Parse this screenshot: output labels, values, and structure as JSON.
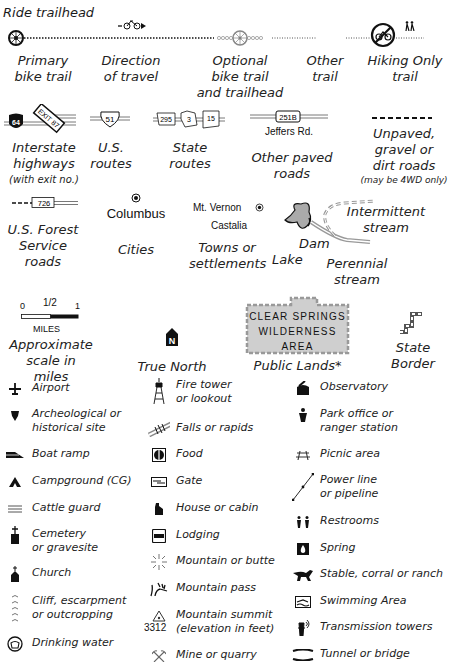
{
  "trails": {
    "ride_trailhead": "Ride trailhead",
    "primary": [
      "Primary",
      "bike trail"
    ],
    "direction": [
      "Direction",
      "of travel"
    ],
    "optional": [
      "Optional",
      "bike trail",
      "and trailhead"
    ],
    "other": [
      "Other",
      "trail"
    ],
    "hiking": [
      "Hiking Only",
      "trail"
    ]
  },
  "roads": {
    "interstate": {
      "shield": "64",
      "exit": "EXIT 87",
      "label": [
        "Interstate",
        "highways"
      ],
      "note": "(with exit no.)"
    },
    "us": {
      "shield": "51",
      "label": [
        "U.S.",
        "routes"
      ]
    },
    "state": {
      "shields": [
        "295",
        "3",
        "15"
      ],
      "label": [
        "State",
        "routes"
      ]
    },
    "other_paved": {
      "shield": "251B",
      "road_name": "Jeffers Rd.",
      "label": "Other paved roads"
    },
    "unpaved": {
      "label": [
        "Unpaved,",
        "gravel or",
        "dirt roads"
      ],
      "note": "(may be 4WD only)"
    },
    "forest": {
      "shield": "726",
      "label": [
        "U.S. Forest",
        "Service roads"
      ]
    }
  },
  "places": {
    "city_name": "Columbus",
    "cities_label": "Cities",
    "town1": "Mt. Vernon",
    "town2": "Castalia",
    "towns_label": [
      "Towns or",
      "settlements"
    ],
    "lake": "Lake",
    "dam": "Dam",
    "intermittent": [
      "Intermittent",
      "stream"
    ],
    "perennial": [
      "Perennial",
      "stream"
    ]
  },
  "scale": {
    "ticks": [
      "0",
      "1/2",
      "1"
    ],
    "unit": "MILES",
    "label": [
      "Approximate",
      "scale in miles"
    ]
  },
  "north": {
    "glyph": "N",
    "label": "True North"
  },
  "public_lands": {
    "box": [
      "CLEAR SPRINGS",
      "WILDERNESS",
      "AREA"
    ],
    "label": "Public Lands*"
  },
  "state_border": {
    "label": [
      "State",
      "Border"
    ]
  },
  "symbols": {
    "col1": [
      {
        "icon": "airport",
        "label": [
          "Airport"
        ]
      },
      {
        "icon": "archeological",
        "label": [
          "Archeological or",
          "historical site"
        ]
      },
      {
        "icon": "boat-ramp",
        "label": [
          "Boat ramp"
        ]
      },
      {
        "icon": "campground",
        "label": [
          "Campground (CG)"
        ]
      },
      {
        "icon": "cattle-guard",
        "label": [
          "Cattle guard"
        ]
      },
      {
        "icon": "cemetery",
        "label": [
          "Cemetery",
          "or gravesite"
        ]
      },
      {
        "icon": "church",
        "label": [
          "Church"
        ]
      },
      {
        "icon": "cliff",
        "label": [
          "Cliff, escarpment",
          "or outcropping"
        ]
      },
      {
        "icon": "drinking-water",
        "label": [
          "Drinking water"
        ]
      }
    ],
    "col2": [
      {
        "icon": "fire-tower",
        "label": [
          "Fire tower",
          "or lookout"
        ]
      },
      {
        "icon": "falls",
        "label": [
          "Falls or rapids"
        ]
      },
      {
        "icon": "food",
        "label": [
          "Food"
        ]
      },
      {
        "icon": "gate",
        "label": [
          "Gate"
        ]
      },
      {
        "icon": "house",
        "label": [
          "House or cabin"
        ]
      },
      {
        "icon": "lodging",
        "label": [
          "Lodging"
        ]
      },
      {
        "icon": "mountain",
        "label": [
          "Mountain or butte"
        ]
      },
      {
        "icon": "mountain-pass",
        "label": [
          "Mountain pass"
        ]
      },
      {
        "icon": "summit",
        "label": [
          "Mountain summit",
          "(elevation in feet)"
        ],
        "elevation": "3312"
      },
      {
        "icon": "mine",
        "label": [
          "Mine or quarry"
        ]
      }
    ],
    "col3": [
      {
        "icon": "observatory",
        "label": [
          "Observatory"
        ]
      },
      {
        "icon": "park-office",
        "label": [
          "Park office or",
          "ranger station"
        ]
      },
      {
        "icon": "picnic",
        "label": [
          "Picnic area"
        ]
      },
      {
        "icon": "power-line",
        "label": [
          "Power line",
          "or pipeline"
        ]
      },
      {
        "icon": "restrooms",
        "label": [
          "Restrooms"
        ]
      },
      {
        "icon": "spring",
        "label": [
          "Spring"
        ]
      },
      {
        "icon": "stable",
        "label": [
          "Stable, corral or ranch"
        ]
      },
      {
        "icon": "swimming",
        "label": [
          "Swimming Area"
        ]
      },
      {
        "icon": "transmission",
        "label": [
          "Transmission towers"
        ]
      },
      {
        "icon": "tunnel",
        "label": [
          "Tunnel or bridge"
        ]
      }
    ]
  }
}
